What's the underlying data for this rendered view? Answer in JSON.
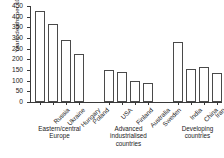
{
  "chart_data": {
    "type": "bar",
    "title": "",
    "xlabel": "",
    "ylabel": "Yearly deaths per 1000 population",
    "ylim": [
      0,
      450
    ],
    "yticks": [
      0,
      50,
      100,
      150,
      200,
      250,
      300,
      350,
      400,
      450
    ],
    "grid": false,
    "legend": "none",
    "categories": [
      "Russia",
      "Ukraine",
      "Hungary",
      "Poland",
      "USA",
      "Finland",
      "Australia",
      "Sweden",
      "India",
      "China",
      "Iran",
      "Cuba"
    ],
    "values": [
      425,
      367,
      291,
      224,
      148,
      142,
      100,
      87,
      283,
      155,
      165,
      135
    ],
    "groups": [
      {
        "label": "Eastern/central Europe",
        "categories": [
          "Russia",
          "Ukraine",
          "Hungary",
          "Poland"
        ],
        "values": [
          425,
          367,
          291,
          224
        ]
      },
      {
        "label": "Advanced industrialised countries",
        "categories": [
          "USA",
          "Finland",
          "Australia",
          "Sweden"
        ],
        "values": [
          148,
          142,
          100,
          87
        ]
      },
      {
        "label": "Developing countries",
        "categories": [
          "India",
          "China",
          "Iran",
          "Cuba"
        ],
        "values": [
          283,
          155,
          165,
          135
        ]
      }
    ],
    "bar_fill": "#ffffff",
    "bar_edge": "#4a4a4a",
    "axis_color": "#3a3a3a"
  },
  "caption": ""
}
